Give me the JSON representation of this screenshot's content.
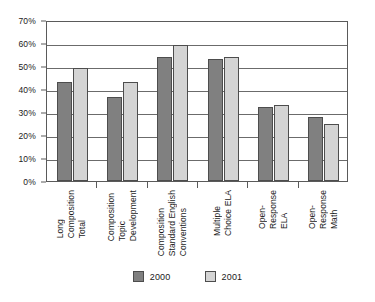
{
  "chart_data": {
    "type": "bar",
    "title": "",
    "subtitle": "",
    "xlabel": "",
    "ylabel": "",
    "ylim": [
      0,
      70
    ],
    "y_tick_labels": [
      "0%",
      "10%",
      "20%",
      "30%",
      "40%",
      "50%",
      "60%",
      "70%"
    ],
    "y_tick_values": [
      0,
      10,
      20,
      30,
      40,
      50,
      60,
      70
    ],
    "grid": true,
    "legend_position": "bottom",
    "categories": [
      "Long Composition Total",
      "Composition Topic Development",
      "Composition Standard English Conventions",
      "Multiple Choice ELA",
      "Open-Response ELA",
      "Open-Response Math"
    ],
    "category_lines": [
      [
        "Long",
        "Composition",
        "Total"
      ],
      [
        "Composition",
        "Topic",
        "Development"
      ],
      [
        "Composition",
        "Standard English",
        "Conventions"
      ],
      [
        "Multiple",
        "Choice ELA"
      ],
      [
        "Open-",
        "Response",
        "ELA"
      ],
      [
        "Open-",
        "Response",
        "Math"
      ]
    ],
    "series": [
      {
        "name": "2000",
        "color": "#808080",
        "values": [
          43,
          36.5,
          54,
          53,
          32,
          28
        ]
      },
      {
        "name": "2001",
        "color": "#d4d4d4",
        "values": [
          49,
          43,
          59,
          54,
          33,
          25
        ]
      }
    ]
  }
}
